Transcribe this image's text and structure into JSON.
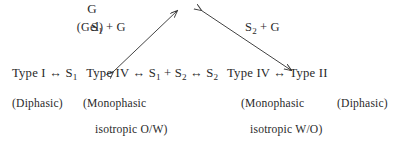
{
  "figure": {
    "background_color": "#ffffff",
    "ink_color": "#2a2a2a",
    "apex": {
      "symbol": "G",
      "sublabel": "(Gel)"
    },
    "arrow_labels": {
      "left": "S₁ + G",
      "right": "S₂ + G"
    },
    "main_row": {
      "left_branch": "Type I ↔ S₁",
      "center_branch": "Type IV ↔ S₁ + S₂ ↔ S₂",
      "right_branch": "Type IV ↔ Type II",
      "tokens": [
        "Type I",
        "↔",
        "S₁",
        "Type IV",
        "↔",
        "S₁",
        "+",
        "S₂",
        "↔",
        "S₂",
        "Type IV",
        "↔",
        "Type II"
      ]
    },
    "captions": {
      "far_left": "(Diphasic)",
      "center_left_line1": "(Monophasic",
      "center_left_line2": "isotropic O/W)",
      "center_right_line1": "(Monophasic",
      "center_right_line2": "isotropic W/O)",
      "far_right": "(Diphasic)"
    },
    "arrows": {
      "left_arrow": "double-headed diagonal arrow from Type IV (lower left) to G (upper right)",
      "right_arrow": "double-headed diagonal arrow from G (upper left) to Type IV (lower right)"
    }
  }
}
